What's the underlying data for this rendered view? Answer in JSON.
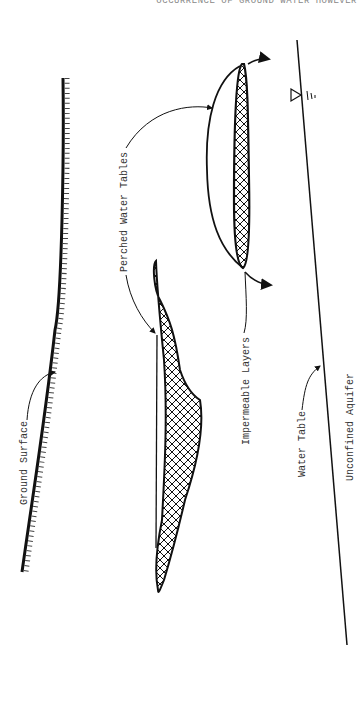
{
  "header": {
    "text": "OCCURRENCE OF GROUND WATER HOWEVER"
  },
  "labels": {
    "ground_surface": "Ground Surface",
    "perched_water_tables": "Perched Water Tables",
    "impermeable_layers": "Impermeable Layers",
    "water_table": "Water Table",
    "unconfined_aquifer": "Unconfined Aquifer"
  },
  "symbols": {
    "water_table_marker": "water-table-triangle"
  },
  "colors": {
    "ink": "#111111",
    "label": "#333333",
    "background": "#ffffff"
  }
}
